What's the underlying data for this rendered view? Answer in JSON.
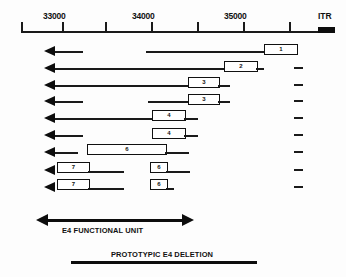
{
  "figure": {
    "title_hidden": "",
    "scale": {
      "axis_label": "genomic coordinates",
      "tick_labels": [
        "33000",
        "34000",
        "35000"
      ],
      "itr_label": "ITR",
      "minor_tick_count": 7
    },
    "transcripts": [
      {
        "id": "row-1",
        "boxes": [
          {
            "label": "1"
          }
        ],
        "has_right_dash": false
      },
      {
        "id": "row-2",
        "boxes": [
          {
            "label": "2"
          }
        ],
        "has_right_dash": true
      },
      {
        "id": "row-3",
        "boxes": [
          {
            "label": "3"
          }
        ],
        "has_right_dash": true
      },
      {
        "id": "row-4",
        "boxes": [
          {
            "label": "3"
          }
        ],
        "has_right_dash": true
      },
      {
        "id": "row-5",
        "boxes": [
          {
            "label": "4"
          }
        ],
        "has_right_dash": true
      },
      {
        "id": "row-6",
        "boxes": [
          {
            "label": "4"
          }
        ],
        "has_right_dash": true
      },
      {
        "id": "row-7",
        "boxes": [
          {
            "label": "6"
          }
        ],
        "has_right_dash": true
      },
      {
        "id": "row-8",
        "boxes": [
          {
            "label": "7"
          },
          {
            "label": "6"
          }
        ],
        "has_right_dash": true
      },
      {
        "id": "row-9",
        "boxes": [
          {
            "label": "7"
          },
          {
            "label": "6"
          }
        ],
        "has_right_dash": true
      }
    ],
    "footer": {
      "functional_unit_label": "E4 FUNCTIONAL UNIT",
      "deletion_label": "PROTOTYPIC E4  DELETION"
    },
    "colors": {
      "ink": "#111111",
      "background": "#fdfdfd"
    }
  }
}
